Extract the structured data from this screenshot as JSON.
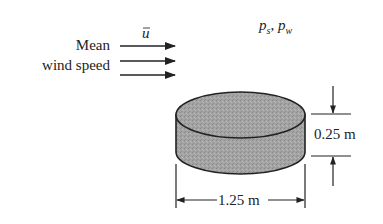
{
  "diagram": {
    "wind_label": {
      "line1": "Mean",
      "line2": "wind speed",
      "symbol": "u",
      "symbol_overbar": true
    },
    "pressure_label": {
      "p_s": "p",
      "p_s_sub": "s",
      "separator": ",",
      "p_w": "p",
      "p_w_sub": "w"
    },
    "object": {
      "shape": "cylinder",
      "fill_color": "#9a9a9a",
      "diameter_label": "1.25 m",
      "height_label": "0.25 m"
    },
    "wind_arrows": 3,
    "colors": {
      "line": "#222222",
      "background": "#ffffff"
    }
  }
}
